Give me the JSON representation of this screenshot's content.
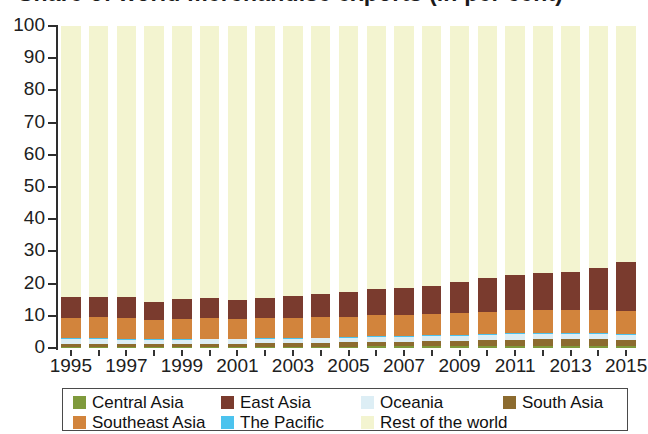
{
  "chart": {
    "title": "Share of world merchandise exports (in per cent)",
    "title_clipped": true
  },
  "legend": {
    "rows": [
      [
        {
          "label": "Central  Asia",
          "color": "#7f9a3c",
          "key": "central_asia"
        },
        {
          "label": "East Asia",
          "color": "#7a3b2e",
          "key": "east_asia"
        },
        {
          "label": "Oceania",
          "color": "#ddeef5",
          "key": "oceania"
        },
        {
          "label": "South Asia",
          "color": "#8c6b2f",
          "key": "south_asia"
        }
      ],
      [
        {
          "label": "Southeast Asia",
          "color": "#d2843c",
          "key": "southeast_asia"
        },
        {
          "label": "The Pacific",
          "color": "#4cc3ee",
          "key": "the_pacific"
        },
        {
          "label": "Rest of the world",
          "color": "#f3f4d0",
          "key": "rest_of_world"
        }
      ]
    ]
  },
  "chart_data": {
    "type": "bar",
    "stacked": true,
    "title": "Share of world merchandise exports (in per cent)",
    "xlabel": "",
    "ylabel": "",
    "ylim": [
      0,
      100
    ],
    "yticks": [
      0,
      10,
      20,
      30,
      40,
      50,
      60,
      70,
      80,
      90,
      100
    ],
    "grid": false,
    "legend_position": "bottom",
    "x": [
      1995,
      1996,
      1997,
      1998,
      1999,
      2000,
      2001,
      2002,
      2003,
      2004,
      2005,
      2006,
      2007,
      2008,
      2009,
      2010,
      2011,
      2012,
      2013,
      2014,
      2015
    ],
    "xtick_labels": [
      "1995",
      "",
      "1997",
      "",
      "1999",
      "",
      "2001",
      "",
      "2003",
      "",
      "2005",
      "",
      "2007",
      "",
      "2009",
      "",
      "2011",
      "",
      "2013",
      "",
      "2015"
    ],
    "series": [
      {
        "name": "Central Asia",
        "color": "#7f9a3c",
        "values": [
          0.2,
          0.2,
          0.2,
          0.2,
          0.2,
          0.3,
          0.3,
          0.3,
          0.3,
          0.4,
          0.4,
          0.5,
          0.5,
          0.6,
          0.5,
          0.6,
          0.7,
          0.7,
          0.7,
          0.6,
          0.5
        ]
      },
      {
        "name": "South Asia",
        "color": "#8c6b2f",
        "values": [
          1.0,
          1.0,
          1.0,
          1.0,
          1.0,
          1.1,
          1.1,
          1.2,
          1.2,
          1.3,
          1.4,
          1.5,
          1.5,
          1.6,
          1.7,
          1.8,
          1.9,
          2.0,
          2.1,
          2.1,
          2.0
        ]
      },
      {
        "name": "Oceania",
        "color": "#ddeef5",
        "values": [
          1.5,
          1.5,
          1.4,
          1.3,
          1.3,
          1.3,
          1.3,
          1.3,
          1.3,
          1.3,
          1.3,
          1.4,
          1.4,
          1.5,
          1.5,
          1.6,
          1.7,
          1.6,
          1.6,
          1.6,
          1.5
        ]
      },
      {
        "name": "The Pacific",
        "color": "#4cc3ee",
        "values": [
          0.1,
          0.1,
          0.1,
          0.1,
          0.1,
          0.1,
          0.1,
          0.1,
          0.1,
          0.1,
          0.1,
          0.1,
          0.1,
          0.1,
          0.1,
          0.1,
          0.1,
          0.1,
          0.1,
          0.1,
          0.1
        ]
      },
      {
        "name": "Southeast Asia",
        "color": "#d2843c",
        "values": [
          6.4,
          6.5,
          6.4,
          5.9,
          6.2,
          6.5,
          6.1,
          6.2,
          6.3,
          6.3,
          6.4,
          6.5,
          6.6,
          6.6,
          6.9,
          7.1,
          7.2,
          7.3,
          7.2,
          7.2,
          7.3
        ]
      },
      {
        "name": "East Asia",
        "color": "#7a3b2e",
        "values": [
          6.6,
          6.5,
          6.6,
          5.5,
          6.1,
          6.2,
          6.0,
          6.4,
          6.9,
          7.4,
          7.6,
          8.2,
          8.5,
          8.6,
          9.6,
          10.5,
          11.0,
          11.5,
          11.9,
          13.3,
          15.3
        ]
      },
      {
        "name": "Rest of the world",
        "color": "#f3f4d0",
        "values": [
          84.2,
          84.2,
          84.3,
          86.0,
          85.1,
          84.5,
          85.1,
          84.5,
          83.9,
          83.2,
          82.8,
          81.8,
          81.4,
          81.0,
          79.7,
          78.3,
          77.4,
          76.8,
          76.4,
          75.1,
          73.3
        ]
      }
    ],
    "stack_totals_excluding_rest": [
      15.8,
      15.8,
      15.7,
      14.0,
      14.9,
      15.5,
      14.9,
      15.5,
      16.1,
      16.8,
      17.2,
      18.2,
      18.6,
      19.0,
      20.3,
      21.7,
      22.6,
      23.2,
      23.6,
      24.9,
      26.7
    ]
  }
}
